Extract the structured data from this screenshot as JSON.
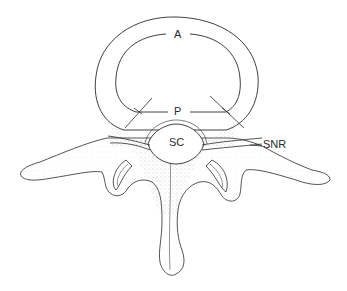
{
  "figure": {
    "type": "anatomical-line-drawing",
    "colors": {
      "ink": "#2a2a2a",
      "stipple": "#8a8a8a",
      "background": "#ffffff"
    }
  },
  "labels": {
    "anterior": "A",
    "posterior": "P",
    "spinal_canal": "SC",
    "spinal_nerve_root": "SNR"
  }
}
